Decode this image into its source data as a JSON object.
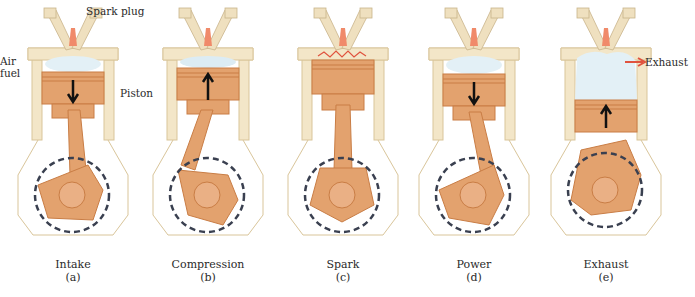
{
  "figure": {
    "type": "four-stroke engine cycle diagram",
    "labels": {
      "spark_plug": "Spark plug",
      "air_fuel_line1": "Air",
      "air_fuel_line2": "fuel",
      "piston": "Piston",
      "exhaust": "Exhaust"
    },
    "stages": [
      {
        "name": "Intake",
        "letter": "(a)",
        "piston": "down",
        "rotation": "clockwise"
      },
      {
        "name": "Compression",
        "letter": "(b)",
        "piston": "up",
        "rotation": "counter-clockwise"
      },
      {
        "name": "Spark",
        "letter": "(c)",
        "piston": "top",
        "rotation": "counter-clockwise"
      },
      {
        "name": "Power",
        "letter": "(d)",
        "piston": "down",
        "rotation": "clockwise"
      },
      {
        "name": "Exhaust",
        "letter": "(e)",
        "piston": "up",
        "rotation": "clockwise"
      }
    ],
    "colors": {
      "cylinder_wall": "#f3e6c8",
      "cylinder_outline": "#d9c59a",
      "piston_copper": "#e3a26e",
      "piston_dark": "#c97d45",
      "gas_cloud": "#e3f0f6",
      "spark_plug": "#f08a6a",
      "intake_arrow": "#e0533e",
      "rotation_arrow": "#3a4050"
    }
  }
}
